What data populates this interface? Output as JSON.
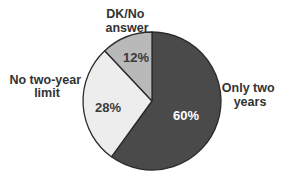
{
  "chart_data": {
    "type": "pie",
    "title": "",
    "start_angle_deg": 0,
    "direction": "clockwise",
    "slices": [
      {
        "label": "Only two years",
        "label_lines": [
          "Only two",
          "years"
        ],
        "value": 60,
        "display": "60%",
        "color": "#4a4a4a",
        "text_color": "#ffffff"
      },
      {
        "label": "No two-year limit",
        "label_lines": [
          "No two-year",
          "limit"
        ],
        "value": 28,
        "display": "28%",
        "color": "#ededed",
        "text_color": "#3a3a3a"
      },
      {
        "label": "DK/No answer",
        "label_lines": [
          "DK/No",
          "answer"
        ],
        "value": 12,
        "display": "12%",
        "color": "#b9b9b9",
        "text_color": "#3a3a3a"
      }
    ],
    "legend": "none (outside slice labels)"
  },
  "outline_color": "#2a2a2a",
  "label_color": "#333333"
}
